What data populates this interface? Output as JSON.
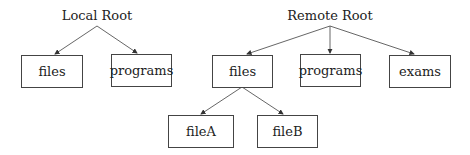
{
  "diagram": {
    "type": "tree",
    "trees": [
      {
        "root": "Local Root",
        "children": [
          {
            "label": "files"
          },
          {
            "label": "programs"
          }
        ]
      },
      {
        "root": "Remote Root",
        "children": [
          {
            "label": "files",
            "children": [
              {
                "label": "fileA"
              },
              {
                "label": "fileB"
              }
            ]
          },
          {
            "label": "programs"
          },
          {
            "label": "exams"
          }
        ]
      }
    ]
  },
  "labels": {
    "local_root": "Local Root",
    "local_files": "files",
    "local_programs": "programs",
    "remote_root": "Remote Root",
    "remote_files": "files",
    "remote_programs": "programs",
    "remote_exams": "exams",
    "file_a": "fileA",
    "file_b": "fileB"
  },
  "colors": {
    "line": "#444444",
    "text": "#222222",
    "background": "#ffffff"
  }
}
